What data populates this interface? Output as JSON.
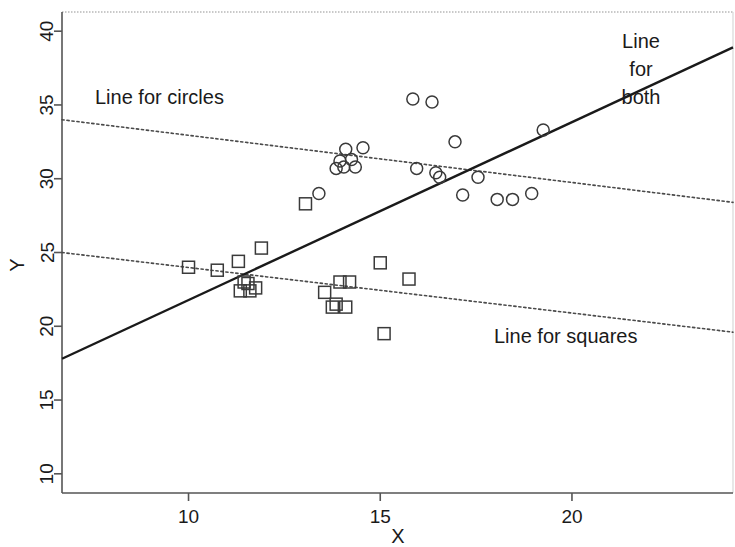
{
  "chart_data": {
    "type": "scatter",
    "title": "",
    "xlabel": "X",
    "ylabel": "Y",
    "xlim": [
      6.7,
      24.2
    ],
    "ylim": [
      8.7,
      41.3
    ],
    "xticks": [
      10,
      15,
      20
    ],
    "yticks": [
      10,
      15,
      20,
      25,
      30,
      35,
      40
    ],
    "grid": false,
    "legend_position": "inline-annotations",
    "annotations": [
      {
        "id": "line-for-circles",
        "text": "Line for circles",
        "x": 11.0,
        "y": 35.3
      },
      {
        "id": "line-for-both",
        "text": "Line\nfor\nboth",
        "x": 23.0,
        "y": 39.3
      },
      {
        "id": "line-for-squares",
        "text": "Line for squares",
        "x": 21.0,
        "y": 20.6
      }
    ],
    "series": [
      {
        "name": "circles",
        "marker": "circle",
        "points": [
          {
            "x": 14.1,
            "y": 32.0
          },
          {
            "x": 14.55,
            "y": 32.1
          },
          {
            "x": 13.95,
            "y": 31.2
          },
          {
            "x": 14.25,
            "y": 31.3
          },
          {
            "x": 14.05,
            "y": 30.8
          },
          {
            "x": 14.35,
            "y": 30.8
          },
          {
            "x": 13.85,
            "y": 30.7
          },
          {
            "x": 15.85,
            "y": 35.4
          },
          {
            "x": 16.35,
            "y": 35.2
          },
          {
            "x": 16.95,
            "y": 32.5
          },
          {
            "x": 19.25,
            "y": 33.3
          },
          {
            "x": 15.95,
            "y": 30.7
          },
          {
            "x": 16.45,
            "y": 30.4
          },
          {
            "x": 16.55,
            "y": 30.1
          },
          {
            "x": 17.55,
            "y": 30.1
          },
          {
            "x": 13.4,
            "y": 29.0
          },
          {
            "x": 17.15,
            "y": 28.9
          },
          {
            "x": 18.05,
            "y": 28.6
          },
          {
            "x": 18.45,
            "y": 28.6
          },
          {
            "x": 18.95,
            "y": 29.0
          }
        ]
      },
      {
        "name": "squares",
        "marker": "square",
        "points": [
          {
            "x": 10.0,
            "y": 24.0
          },
          {
            "x": 10.75,
            "y": 23.8
          },
          {
            "x": 11.3,
            "y": 24.4
          },
          {
            "x": 11.9,
            "y": 25.3
          },
          {
            "x": 11.45,
            "y": 23.0
          },
          {
            "x": 11.55,
            "y": 22.9
          },
          {
            "x": 11.35,
            "y": 22.4
          },
          {
            "x": 11.6,
            "y": 22.4
          },
          {
            "x": 11.75,
            "y": 22.6
          },
          {
            "x": 13.05,
            "y": 28.3
          },
          {
            "x": 13.55,
            "y": 22.3
          },
          {
            "x": 13.95,
            "y": 23.0
          },
          {
            "x": 14.2,
            "y": 23.0
          },
          {
            "x": 13.85,
            "y": 21.5
          },
          {
            "x": 13.75,
            "y": 21.3
          },
          {
            "x": 14.1,
            "y": 21.3
          },
          {
            "x": 15.0,
            "y": 24.3
          },
          {
            "x": 15.75,
            "y": 23.2
          },
          {
            "x": 15.1,
            "y": 19.5
          }
        ]
      }
    ],
    "fit_lines": [
      {
        "id": "line-for-circles",
        "style": "dotted",
        "x0": 6.7,
        "y0": 34.0,
        "x1": 24.2,
        "y1": 28.4
      },
      {
        "id": "line-for-squares",
        "style": "dotted",
        "x0": 6.7,
        "y0": 25.0,
        "x1": 24.2,
        "y1": 19.6
      },
      {
        "id": "line-for-both",
        "style": "solid",
        "x0": 6.7,
        "y0": 17.8,
        "x1": 24.2,
        "y1": 38.9
      }
    ]
  },
  "axes": {
    "x_label": "X",
    "y_label": "Y",
    "x_tick_labels": [
      "10",
      "15",
      "20"
    ],
    "y_tick_labels": [
      "10",
      "15",
      "20",
      "25",
      "30",
      "35",
      "40"
    ]
  },
  "labels": {
    "circles": "Line for circles",
    "both_line1": "Line",
    "both_line2": "for",
    "both_line3": "both",
    "squares": "Line for squares"
  },
  "colors": {
    "marker_stroke": "#3a3a3a",
    "fit_solid": "#1a1a1a",
    "fit_dotted": "#4a4a4a",
    "axis": "#555555",
    "background": "#ffffff"
  }
}
